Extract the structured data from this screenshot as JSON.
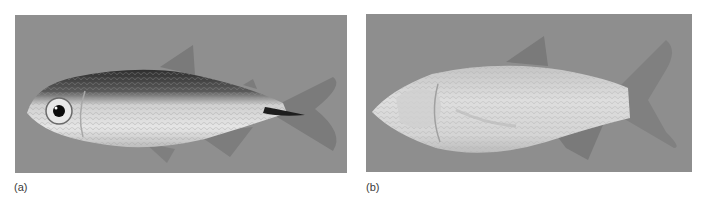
{
  "figure": {
    "panels": [
      {
        "id": "a",
        "label": "(a)",
        "subject": "surface-dwelling fish with eyes and dark pigmentation",
        "background_color": "#8f8f8f"
      },
      {
        "id": "b",
        "label": "(b)",
        "subject": "eyeless, depigmented cave fish",
        "background_color": "#8e8e8e"
      }
    ]
  }
}
